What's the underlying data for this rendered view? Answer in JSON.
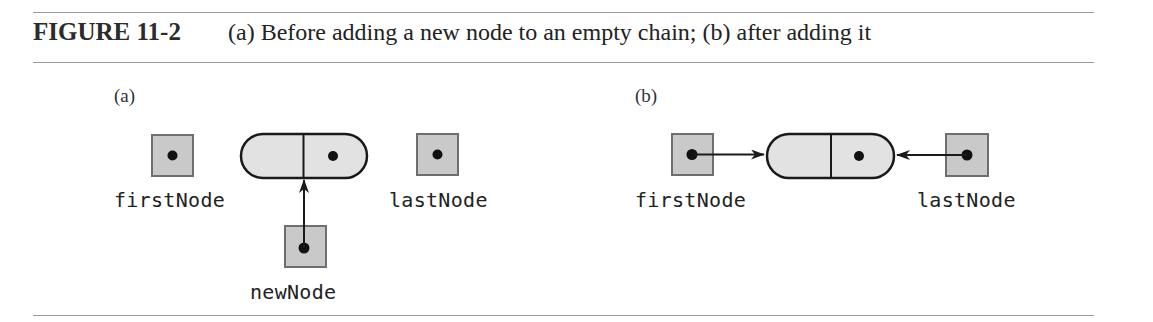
{
  "figure": {
    "number": "FIGURE 11-2",
    "caption": "(a) Before adding a new node to an empty chain; (b) after adding it"
  },
  "panels": [
    {
      "label": "(a)",
      "variables": [
        {
          "name": "firstNode",
          "value": "null"
        },
        {
          "name": "lastNode",
          "value": "null"
        },
        {
          "name": "newNode",
          "points_to": "node"
        }
      ],
      "nodes": [
        {
          "data": "",
          "next": "null"
        }
      ]
    },
    {
      "label": "(b)",
      "variables": [
        {
          "name": "firstNode",
          "points_to": "node"
        },
        {
          "name": "lastNode",
          "points_to": "node"
        }
      ],
      "nodes": [
        {
          "data": "",
          "next": "null"
        }
      ]
    }
  ],
  "colors": {
    "box_fill": "#c9c9c9",
    "box_border": "#6e6e6e",
    "node_fill": "#e2e2e2",
    "stroke": "#1a1a1a",
    "rule": "#9a9a9a"
  }
}
